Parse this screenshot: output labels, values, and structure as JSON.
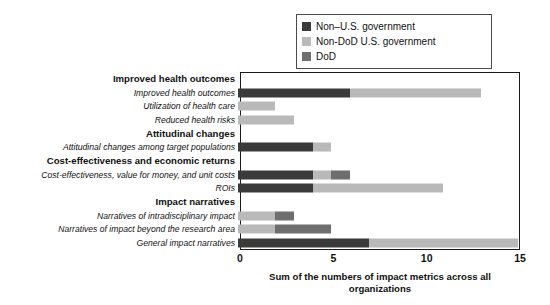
{
  "chart_data": {
    "type": "bar",
    "orientation": "horizontal",
    "stacked": true,
    "title": "",
    "xlabel": "Sum of the numbers of impact metrics across all organizations",
    "ylabel": "",
    "xlim": [
      0,
      15
    ],
    "xticks": [
      0,
      5,
      10,
      15
    ],
    "xtick_labels": [
      "0",
      "5",
      "10",
      "15"
    ],
    "grid": false,
    "legend_position": "top-right",
    "series": [
      {
        "name": "Non–U.S. government",
        "color": "#3a3a3a",
        "values": [
          null,
          6,
          0,
          0,
          null,
          4,
          null,
          4,
          4,
          null,
          0,
          0,
          7
        ]
      },
      {
        "name": "Non-DoD U.S. government",
        "color": "#b9b9b9",
        "values": [
          null,
          7,
          2,
          3,
          null,
          1,
          null,
          1,
          7,
          null,
          2,
          2,
          8
        ]
      },
      {
        "name": "DoD",
        "color": "#6e6e6e",
        "values": [
          null,
          0,
          0,
          0,
          null,
          0,
          null,
          1,
          0,
          null,
          1,
          3,
          0
        ]
      }
    ],
    "categories": [
      {
        "label": "Improved health outcomes",
        "type": "group"
      },
      {
        "label": "Improved health outcomes",
        "type": "item",
        "total": 13
      },
      {
        "label": "Utilization of health care",
        "type": "item",
        "total": 2
      },
      {
        "label": "Reduced health risks",
        "type": "item",
        "total": 3
      },
      {
        "label": "Attitudinal changes",
        "type": "group"
      },
      {
        "label": "Attitudinal changes among target populations",
        "type": "item",
        "total": 5
      },
      {
        "label": "Cost-effectiveness and economic returns",
        "type": "group"
      },
      {
        "label": "Cost-effectiveness, value for money, and unit costs",
        "type": "item",
        "total": 6
      },
      {
        "label": "ROIs",
        "type": "item",
        "total": 11
      },
      {
        "label": "Impact narratives",
        "type": "group"
      },
      {
        "label": "Narratives of intradisciplinary impact",
        "type": "item",
        "total": 3
      },
      {
        "label": "Narratives of impact beyond the research area",
        "type": "item",
        "total": 5
      },
      {
        "label": "General impact narratives",
        "type": "item",
        "total": 15
      }
    ]
  },
  "legend": {
    "items": [
      {
        "label": "Non–U.S. government",
        "color": "#3a3a3a",
        "swatch_name": "legend-swatch-non-us-government"
      },
      {
        "label": "Non-DoD U.S. government",
        "color": "#b9b9b9",
        "swatch_name": "legend-swatch-non-dod-us-government"
      },
      {
        "label": "DoD",
        "color": "#6e6e6e",
        "swatch_name": "legend-swatch-dod"
      }
    ]
  },
  "axis": {
    "x_tick_labels": [
      "0",
      "5",
      "10",
      "15"
    ],
    "x_axis_title_line1": "Sum of the numbers of impact metrics across all",
    "x_axis_title_line2": "organizations"
  },
  "rows": [
    {
      "label": "Improved health outcomes",
      "type": "group",
      "segments": []
    },
    {
      "label": "Improved health outcomes",
      "type": "item",
      "segments": [
        {
          "series": "Non–U.S. government",
          "start": 0,
          "end": 6,
          "color": "#3a3a3a"
        },
        {
          "series": "Non-DoD U.S. government",
          "start": 6,
          "end": 13,
          "color": "#b9b9b9"
        }
      ]
    },
    {
      "label": "Utilization of health care",
      "type": "item",
      "segments": [
        {
          "series": "Non-DoD U.S. government",
          "start": 0,
          "end": 2,
          "color": "#b9b9b9"
        }
      ]
    },
    {
      "label": "Reduced health risks",
      "type": "item",
      "segments": [
        {
          "series": "Non-DoD U.S. government",
          "start": 0,
          "end": 3,
          "color": "#b9b9b9"
        }
      ]
    },
    {
      "label": "Attitudinal changes",
      "type": "group",
      "segments": []
    },
    {
      "label": "Attitudinal changes among target populations",
      "type": "item",
      "segments": [
        {
          "series": "Non–U.S. government",
          "start": 0,
          "end": 4,
          "color": "#3a3a3a"
        },
        {
          "series": "Non-DoD U.S. government",
          "start": 4,
          "end": 5,
          "color": "#b9b9b9"
        }
      ]
    },
    {
      "label": "Cost-effectiveness and economic returns",
      "type": "group",
      "segments": []
    },
    {
      "label": "Cost-effectiveness, value for money, and unit costs",
      "type": "item",
      "segments": [
        {
          "series": "Non–U.S. government",
          "start": 0,
          "end": 4,
          "color": "#3a3a3a"
        },
        {
          "series": "Non-DoD U.S. government",
          "start": 4,
          "end": 5,
          "color": "#b9b9b9"
        },
        {
          "series": "DoD",
          "start": 5,
          "end": 6,
          "color": "#6e6e6e"
        }
      ]
    },
    {
      "label": "ROIs",
      "type": "item",
      "segments": [
        {
          "series": "Non–U.S. government",
          "start": 0,
          "end": 4,
          "color": "#3a3a3a"
        },
        {
          "series": "Non-DoD U.S. government",
          "start": 4,
          "end": 11,
          "color": "#b9b9b9"
        }
      ]
    },
    {
      "label": "Impact narratives",
      "type": "group",
      "segments": []
    },
    {
      "label": "Narratives of intradisciplinary impact",
      "type": "item",
      "segments": [
        {
          "series": "Non-DoD U.S. government",
          "start": 0,
          "end": 2,
          "color": "#b9b9b9"
        },
        {
          "series": "DoD",
          "start": 2,
          "end": 3,
          "color": "#6e6e6e"
        }
      ]
    },
    {
      "label": "Narratives of impact beyond the research area",
      "type": "item",
      "segments": [
        {
          "series": "Non-DoD U.S. government",
          "start": 0,
          "end": 2,
          "color": "#b9b9b9"
        },
        {
          "series": "DoD",
          "start": 2,
          "end": 5,
          "color": "#6e6e6e"
        }
      ]
    },
    {
      "label": "General impact narratives",
      "type": "item",
      "segments": [
        {
          "series": "Non–U.S. government",
          "start": 0,
          "end": 7,
          "color": "#3a3a3a"
        },
        {
          "series": "Non-DoD U.S. government",
          "start": 7,
          "end": 15,
          "color": "#b9b9b9"
        }
      ]
    }
  ]
}
